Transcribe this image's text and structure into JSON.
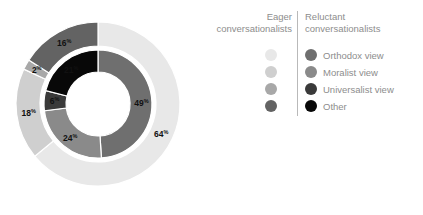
{
  "legend": {
    "header_left": "Eager\nconversationalists",
    "header_left_line1": "Eager",
    "header_left_line2": "conversationalists",
    "header_right_line1": "Reluctant",
    "header_right_line2": "conversationalists",
    "rows": [
      {
        "label": "Orthodox view",
        "eager_color": "#e8e8e8",
        "reluctant_color": "#6f6f6f"
      },
      {
        "label": "Moralist view",
        "eager_color": "#cfcfcf",
        "reluctant_color": "#8a8a8a"
      },
      {
        "label": "Universalist view",
        "eager_color": "#a8a8a8",
        "reluctant_color": "#3a3a3a"
      },
      {
        "label": "Other",
        "eager_color": "#636363",
        "reluctant_color": "#080808"
      }
    ]
  },
  "chart_data": {
    "type": "pie",
    "title": "",
    "subtitle": "",
    "xlabel": "",
    "ylabel": "",
    "legend_position": "right",
    "start_angle_deg": 0,
    "direction": "clockwise",
    "center": {
      "x": 98,
      "y": 104
    },
    "radii": {
      "outer_r_out": 82,
      "outer_r_in": 58,
      "inner_r_out": 54,
      "inner_r_in": 32
    },
    "gap_color": "#ffffff",
    "background": "#ffffff",
    "rings": [
      {
        "name": "Eager conversationalists",
        "ring": "outer",
        "categories": [
          "Orthodox view",
          "Moralist view",
          "Universalist view",
          "Other"
        ],
        "values": [
          64,
          18,
          2,
          16
        ],
        "value_labels": [
          "64",
          "18",
          "2",
          "16"
        ],
        "unit": "%",
        "colors": [
          "#e8e8e8",
          "#cfcfcf",
          "#a8a8a8",
          "#636363"
        ]
      },
      {
        "name": "Reluctant conversationalists",
        "ring": "inner",
        "categories": [
          "Orthodox view",
          "Moralist view",
          "Universalist view",
          "Other"
        ],
        "values": [
          49,
          24,
          6,
          21
        ],
        "value_labels": [
          "49",
          "24",
          "6",
          "21"
        ],
        "unit": "%",
        "colors": [
          "#6f6f6f",
          "#8a8a8a",
          "#3a3a3a",
          "#080808"
        ]
      }
    ]
  }
}
